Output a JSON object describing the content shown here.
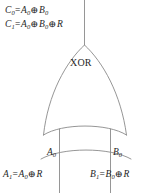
{
  "figure": {
    "background_color": "#ffffff",
    "line_color": "#8a8a8a",
    "text_color": "#262626"
  },
  "gate": {
    "label": "XOR",
    "type": "xor-gate"
  },
  "outputs": {
    "c0": {
      "lhs": "C",
      "lhs_sub": "0",
      "eq": "=",
      "term1": "A",
      "term1_sub": "0",
      "op1": "⊕",
      "term2": "B",
      "term2_sub": "0",
      "full_text": "C0 = A0 ⊕ B0"
    },
    "c1": {
      "lhs": "C",
      "lhs_sub": "1",
      "eq": "=",
      "term1": "A",
      "term1_sub": "0",
      "op1": "⊕",
      "term2": "B",
      "term2_sub": "0",
      "op2": "⊕",
      "term3": "R",
      "full_text": "C1 = A0 ⊕ B0 ⊕ R"
    }
  },
  "inputs": {
    "a0_label": "A",
    "a0_sub": "0",
    "b0_label": "B",
    "b0_sub": "0",
    "a1": {
      "lhs": "A",
      "lhs_sub": "1",
      "eq": "=",
      "term1": "A",
      "term1_sub": "0",
      "op1": "⊕",
      "term2": "R",
      "full_text": "A1 = A0 ⊕ R"
    },
    "b1": {
      "lhs": "B",
      "lhs_sub": "1",
      "eq": "=",
      "term1": "B",
      "term1_sub": "0",
      "op1": "⊕",
      "term2": "R",
      "full_text": "B1 = B0 ⊕ R"
    }
  }
}
